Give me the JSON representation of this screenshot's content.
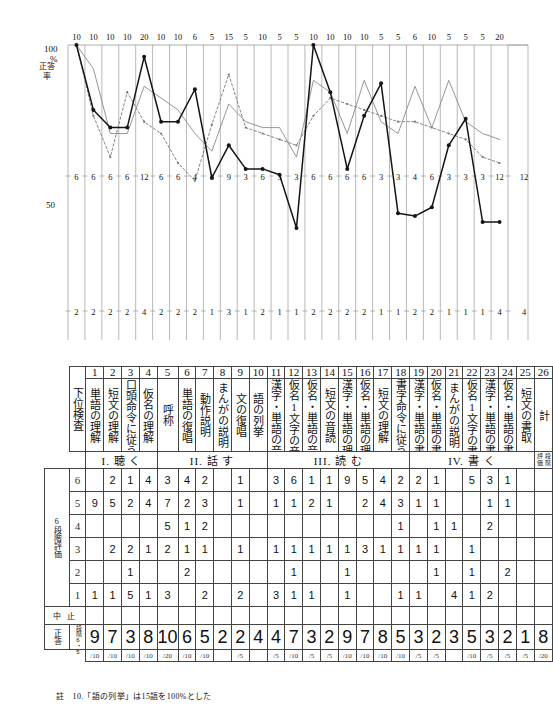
{
  "chart_data": {
    "type": "line",
    "title": "",
    "ylabel": "正答率",
    "ylim": [
      0,
      100
    ],
    "ytick_labels": [
      "100",
      "%",
      "50"
    ],
    "grid": true,
    "legend": "none",
    "n_columns": 26,
    "top_row_values": [
      "10",
      "10",
      "10",
      "10",
      "20",
      "10",
      "10",
      "6",
      "5",
      "15",
      "5",
      "10",
      "5",
      "5",
      "10",
      "10",
      "10",
      "10",
      "5",
      "5",
      "6",
      "10",
      "5",
      "5",
      "5",
      "20"
    ],
    "mid_row_values": [
      "6",
      "6",
      "6",
      "6",
      "12",
      "6",
      "6",
      "4",
      "3",
      "9",
      "3",
      "6",
      "3",
      "3",
      "6",
      "6",
      "6",
      "6",
      "3",
      "3",
      "4",
      "6",
      "3",
      "3",
      "3",
      "12"
    ],
    "bot_row_values": [
      "2",
      "2",
      "2",
      "2",
      "4",
      "2",
      "2",
      "2",
      "1",
      "3",
      "1",
      "2",
      "1",
      "1",
      "2",
      "2",
      "2",
      "2",
      "1",
      "1",
      "2",
      "2",
      "1",
      "1",
      "1",
      "4"
    ],
    "series": [
      {
        "name": "solid-thick",
        "values": [
          100,
          78,
          72,
          72,
          96,
          74,
          74,
          85,
          55,
          66,
          58,
          58,
          56,
          38,
          100,
          84,
          58,
          76,
          87,
          43,
          42,
          45,
          66,
          75,
          40,
          40
        ]
      },
      {
        "name": "solid-thin",
        "values": [
          100,
          92,
          70,
          70,
          86,
          82,
          78,
          70,
          64,
          80,
          74,
          72,
          72,
          62,
          88,
          84,
          70,
          88,
          74,
          70,
          86,
          72,
          88,
          74,
          70,
          68
        ]
      },
      {
        "name": "dotted",
        "values": [
          100,
          76,
          62,
          84,
          74,
          70,
          60,
          54,
          73,
          90,
          72,
          70,
          68,
          66,
          76,
          82,
          80,
          78,
          76,
          74,
          74,
          72,
          70,
          68,
          62,
          60
        ]
      }
    ],
    "axis_note": "縦軸は正答率(%)、上段=満点, 中段=中央値, 下段=下限"
  },
  "graph": {
    "y_axis_label": "正答率",
    "y_100": "100",
    "y_percent": "%",
    "y_50": "50",
    "top_numbers": [
      "10",
      "10",
      "10",
      "10",
      "20",
      "10",
      "10",
      "6",
      "5",
      "15",
      "5",
      "10",
      "5",
      "5",
      "10",
      "10",
      "10",
      "10",
      "5",
      "5",
      "6",
      "10",
      "5",
      "5",
      "5",
      "20"
    ],
    "mid_numbers": [
      "6",
      "6",
      "6",
      "6",
      "12",
      "6",
      "6",
      "4",
      "3",
      "9",
      "3",
      "6",
      "3",
      "3",
      "6",
      "6",
      "6",
      "6",
      "3",
      "3",
      "4",
      "6",
      "3",
      "3",
      "3",
      "12"
    ],
    "bot_numbers": [
      "2",
      "2",
      "2",
      "2",
      "4",
      "2",
      "2",
      "2",
      "1",
      "3",
      "1",
      "2",
      "1",
      "1",
      "2",
      "2",
      "2",
      "2",
      "1",
      "1",
      "2",
      "2",
      "1",
      "1",
      "1",
      "4"
    ],
    "right_mid_number": "12",
    "right_bot_number": "4"
  },
  "table": {
    "row_header_label": "下位検査",
    "numbers": [
      "1",
      "2",
      "3",
      "4",
      "5",
      "6",
      "7",
      "8",
      "9",
      "10",
      "11",
      "12",
      "13",
      "14",
      "15",
      "16",
      "17",
      "18",
      "19",
      "20",
      "21",
      "22",
      "23",
      "24",
      "25",
      "26"
    ],
    "labels": [
      "単語の理解",
      "短文の理解",
      "口頭命令に従う",
      "仮名の理解",
      "呼称",
      "単語の復唱",
      "動作説明",
      "まんがの説明",
      "文の復唱",
      "語の列挙",
      "漢字・単語の音読",
      "仮名1文字の音読",
      "仮名・単語の音読",
      "短文の音読",
      "漢字・単語の理解",
      "仮名・単語の理解",
      "短文の理解",
      "書字命令に従う",
      "漢字・単語の書字",
      "仮名・単語の書字",
      "まんがの説明",
      "仮名1文字の書取",
      "漢字・単語の書取",
      "仮名・単語の書取",
      "短文の書取",
      "計"
    ],
    "sections": [
      {
        "label": "I. 聴 く",
        "span": 4
      },
      {
        "label": "II. 話 す",
        "span": 6
      },
      {
        "label": "III. 読 む",
        "span": 4
      },
      {
        "label": "IV. 書 く",
        "span": 7
      }
    ],
    "sections_full": [
      {
        "label": "I. 聴 く",
        "start": 1,
        "end": 4
      },
      {
        "label": "II. 話 す",
        "start": 5,
        "end": 10
      },
      {
        "label": "III. 読 む",
        "start": 11,
        "end": 18
      },
      {
        "label": "IV. 書 く",
        "start": 19,
        "end": 25
      }
    ],
    "sum_col_label": "計",
    "sum_col_sub": "段階評価",
    "left_group_label": "6段階評価",
    "mid_group_label_a": "段階",
    "mid_group_label_b": "語数",
    "mid_group_label_c": "段階",
    "right_group_label": "正答",
    "grade_rows": [
      "6",
      "5",
      "4",
      "3",
      "2",
      "1"
    ],
    "grid": [
      [
        "",
        "2",
        "1",
        "4",
        "3",
        "4",
        "2",
        "",
        "1",
        "",
        "3",
        "6",
        "1",
        "1",
        "9",
        "5",
        "4",
        "2",
        "2",
        "1",
        "",
        "5",
        "3",
        "1",
        "",
        ""
      ],
      [
        "9",
        "5",
        "2",
        "4",
        "7",
        "2",
        "3",
        "",
        "1",
        "",
        "1",
        "1",
        "2",
        "1",
        "",
        "2",
        "4",
        "3",
        "1",
        "1",
        "",
        "",
        "1",
        "1",
        "",
        ""
      ],
      [
        "",
        "",
        "",
        "",
        "5",
        "1",
        "2",
        "",
        "",
        "",
        "",
        "",
        "",
        "",
        "",
        "",
        "",
        "1",
        "",
        "1",
        "1",
        "",
        "2",
        "",
        "",
        ""
      ],
      [
        "",
        "2",
        "2",
        "1",
        "2",
        "1",
        "1",
        "",
        "1",
        "",
        "1",
        "1",
        "1",
        "1",
        "1",
        "3",
        "1",
        "1",
        "1",
        "1",
        "",
        "1",
        "",
        "",
        "",
        ""
      ],
      [
        "",
        "",
        "1",
        "",
        "",
        "2",
        "",
        "",
        "",
        "",
        "",
        "1",
        "",
        "",
        "1",
        "",
        "",
        "",
        "",
        "1",
        "",
        "1",
        "",
        "2",
        "",
        ""
      ],
      [
        "1",
        "1",
        "5",
        "1",
        "3",
        "",
        "2",
        "",
        "2",
        "",
        "3",
        "1",
        "1",
        "",
        "1",
        "",
        "",
        "1",
        "1",
        "",
        "4",
        "1",
        "2",
        "",
        "",
        ""
      ]
    ],
    "grid_rows": [
      {
        "grade": "6",
        "cells": [
          "",
          "2",
          "1",
          "4",
          "3",
          "4",
          "2",
          "",
          "1",
          "",
          "3",
          "6",
          "1",
          "1",
          "9",
          "5",
          "4",
          "2",
          "2",
          "1",
          "",
          "5",
          "3",
          "1",
          "",
          ""
        ]
      },
      {
        "grade": "5",
        "cells": [
          "9",
          "5",
          "2",
          "4",
          "7",
          "2",
          "3",
          "",
          "1",
          "",
          "1",
          "1",
          "2",
          "1",
          "",
          "2",
          "4",
          "3",
          "1",
          "1",
          "",
          "",
          "1",
          "1",
          "",
          ""
        ]
      },
      {
        "grade": "4",
        "cells": [
          "",
          "",
          "",
          "",
          "5",
          "1",
          "2",
          "",
          "",
          "",
          "",
          "",
          "",
          "",
          "",
          "",
          "",
          "1",
          "",
          "1",
          "1",
          "",
          "2",
          "",
          "",
          ""
        ]
      },
      {
        "grade": "3",
        "cells": [
          "",
          "2",
          "2",
          "1",
          "2",
          "1",
          "1",
          "",
          "1",
          "",
          "1",
          "1",
          "1",
          "1",
          "1",
          "3",
          "1",
          "1",
          "1",
          "1",
          "",
          "1",
          "",
          "",
          "",
          ""
        ]
      },
      {
        "grade": "2",
        "cells": [
          "",
          "",
          "1",
          "",
          "",
          "2",
          "",
          "",
          "",
          "",
          "",
          "1",
          "",
          "",
          "1",
          "",
          "",
          "",
          "",
          "1",
          "",
          "1",
          "",
          "2",
          "",
          ""
        ]
      },
      {
        "grade": "1",
        "cells": [
          "1",
          "1",
          "5",
          "1",
          "3",
          "",
          "2",
          "",
          "2",
          "",
          "3",
          "1",
          "1",
          "",
          "1",
          "",
          "",
          "1",
          "1",
          "",
          "4",
          "1",
          "2",
          "",
          "",
          ""
        ]
      }
    ],
    "stop_label": "中 止",
    "stop_cells": [
      "",
      "",
      "",
      "",
      "",
      "",
      "",
      "",
      "",
      "",
      "",
      "",
      "",
      "",
      "",
      "",
      "",
      "",
      "",
      "",
      "",
      "",
      "",
      "",
      "",
      ""
    ],
    "answer_label": "正答",
    "answer_sub": "段階6・5",
    "answer_values": [
      "9",
      "7",
      "3",
      "8",
      "10",
      "6",
      "5",
      "2",
      "2",
      "4",
      "4",
      "7",
      "3",
      "2",
      "9",
      "7",
      "8",
      "5",
      "3",
      "2",
      "3",
      "5",
      "3",
      "2",
      "1",
      "8"
    ],
    "denominators": [
      "/10",
      "/10",
      "/10",
      "/10",
      "/20",
      "/10",
      "/10",
      "",
      "/5",
      "",
      "/5",
      "/10",
      "/5",
      "/5",
      "/10",
      "/10",
      "/10",
      "/10",
      "/5",
      "/5",
      "",
      "/10",
      "/5",
      "/5",
      "/5",
      "/20"
    ],
    "right_edge_top": "正",
    "right_edge_bottom": "答"
  },
  "footnote": {
    "text": "註　10.「語の列挙」は15語を100%とした"
  },
  "colors": {
    "ink": "#111111",
    "grid": "#9a9a9a",
    "rule": "#444444",
    "paper": "#ffffff"
  }
}
